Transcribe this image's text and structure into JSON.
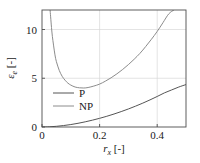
{
  "chart_data": {
    "type": "line",
    "title": "",
    "xlabel": "r_x [-]",
    "xlabel_parts": {
      "symbol": "r",
      "subscript": "x",
      "units": "[-]"
    },
    "ylabel": "ε_e [-]",
    "ylabel_parts": {
      "symbol": "ε",
      "subscript": "e",
      "units": "[-]"
    },
    "xlim": [
      0,
      0.5
    ],
    "ylim": [
      0,
      12
    ],
    "xticks": [
      0,
      0.2,
      0.4
    ],
    "xtick_labels": [
      "0",
      "0.2",
      "0.4"
    ],
    "yticks": [
      0,
      5,
      10
    ],
    "ytick_labels": [
      "0",
      "5",
      "10"
    ],
    "grid": true,
    "grid_color": "#d9d9d9",
    "frame_color": "#4d4d4d",
    "legend_position": "lower-left-inside",
    "series": [
      {
        "name": "P",
        "label": "P",
        "color": "#555555",
        "x": [
          0.0,
          0.025,
          0.05,
          0.075,
          0.1,
          0.125,
          0.15,
          0.175,
          0.2,
          0.225,
          0.25,
          0.275,
          0.3,
          0.325,
          0.35,
          0.375,
          0.4,
          0.425,
          0.45,
          0.475,
          0.5
        ],
        "y": [
          0.0,
          0.02,
          0.07,
          0.15,
          0.25,
          0.38,
          0.53,
          0.7,
          0.89,
          1.1,
          1.33,
          1.58,
          1.85,
          2.14,
          2.45,
          2.78,
          3.13,
          3.5,
          3.8,
          4.1,
          4.35
        ]
      },
      {
        "name": "NP",
        "label": "NP",
        "color": "#8c8c8c",
        "x": [
          0.028,
          0.03,
          0.033,
          0.036,
          0.04,
          0.045,
          0.05,
          0.06,
          0.07,
          0.08,
          0.09,
          0.1,
          0.115,
          0.13,
          0.145,
          0.16,
          0.18,
          0.2,
          0.22,
          0.24,
          0.26,
          0.28,
          0.3,
          0.32,
          0.34,
          0.36,
          0.38,
          0.4,
          0.42,
          0.44,
          0.458
        ],
        "y": [
          12.0,
          11.3,
          10.2,
          9.3,
          8.4,
          7.4,
          6.7,
          5.8,
          5.2,
          4.8,
          4.5,
          4.3,
          4.1,
          4.02,
          4.0,
          4.05,
          4.2,
          4.4,
          4.7,
          5.05,
          5.45,
          5.9,
          6.4,
          6.95,
          7.55,
          8.25,
          9.0,
          9.8,
          10.7,
          11.6,
          12.0
        ]
      }
    ],
    "annotations": {
      "np_asymptote_x": 0.028,
      "np_minimum": {
        "x": 0.145,
        "y": 4.0
      }
    }
  },
  "legend": {
    "items": [
      {
        "label": "P"
      },
      {
        "label": "NP"
      }
    ]
  }
}
